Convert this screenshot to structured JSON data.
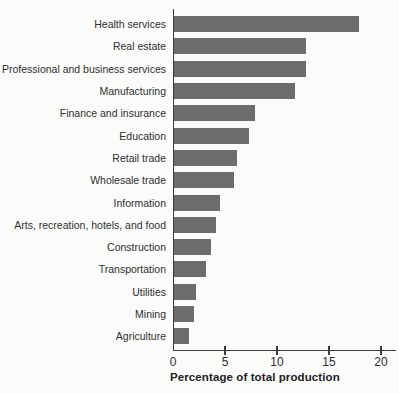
{
  "chart_data": {
    "type": "bar",
    "orientation": "horizontal",
    "title": "",
    "xlabel": "Percentage of total production",
    "ylabel": "",
    "xlim": [
      0,
      20
    ],
    "xticks": [
      0,
      5,
      10,
      15,
      20
    ],
    "grid": false,
    "legend": "none",
    "categories": [
      "Health services",
      "Real estate",
      "Professional and business services",
      "Manufacturing",
      "Finance and insurance",
      "Education",
      "Retail trade",
      "Wholesale trade",
      "Information",
      "Arts, recreation, hotels, and food",
      "Construction",
      "Transportation",
      "Utilities",
      "Mining",
      "Agriculture"
    ],
    "values": [
      17.8,
      12.7,
      12.7,
      11.6,
      7.8,
      7.2,
      6.1,
      5.8,
      4.4,
      4.0,
      3.6,
      3.1,
      2.1,
      1.9,
      1.4
    ],
    "colors": {
      "bar": "#6d6d6d",
      "axis": "#3c3c3c",
      "text": "#2f2f2f",
      "background": "#fbfbfa"
    }
  }
}
